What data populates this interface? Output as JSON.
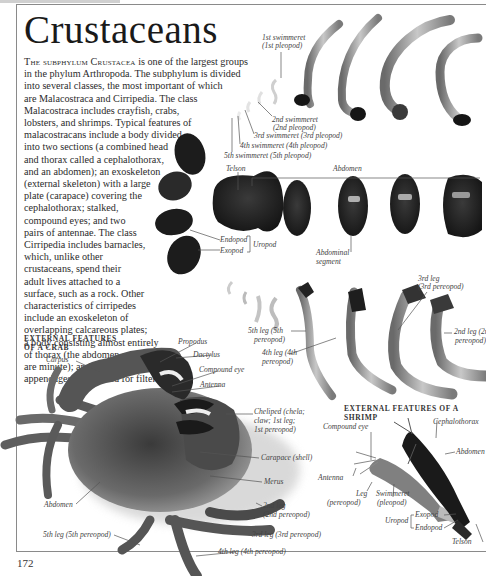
{
  "page": {
    "title": "Crustaceans",
    "page_number": "172"
  },
  "intro": {
    "lead_smallcaps": "The subphylum Crustacea",
    "lines": [
      " is one of the largest groups",
      "in the phylum Arthropoda. The subphylum is divided",
      "into several classes, the most important of which",
      "are Malacostraca and Cirripedia. The class",
      "Malacostraca includes crayfish, crabs,",
      "lobsters, and shrimps. Typical features of",
      "malacostracans include a body divided",
      "into two sections (a combined head",
      "and thorax called a cephalothorax,",
      "and an abdomen); an exoskeleton",
      "(external skeleton) with a large",
      "plate (carapace) covering the",
      "cephalothorax; stalked,",
      "compound eyes; and two",
      "pairs of antennae. The class",
      "Cirripedia includes barnacles,",
      "which, unlike other",
      "crustaceans, spend their",
      "adult lives attached to a",
      "surface, such as a rock. Other",
      "characteristics of cirripedes",
      "include an exoskeleton of",
      "overlapping calcareous plates;",
      "a body consisting almost entirely",
      "of thorax (the abdomen and head",
      "are minute); and six pairs of thoracic",
      "appendages (cirri) used for filter feeding."
    ]
  },
  "swimmerets": {
    "labels": [
      "1st swimmeret",
      "(1st pleopod)",
      "2nd swimmeret",
      "(2nd pleopod)",
      "3rd swimmeret (3rd pleopod)",
      "4th swimmeret (4th pleopod)",
      "5th swimmeret (5th pleopod)"
    ]
  },
  "tail": {
    "telson": "Telson",
    "abdomen": "Abdomen",
    "endopod": "Endopod",
    "exopod": "Exopod",
    "uropod": "Uropod",
    "abdominal_segment_1": "Abdominal",
    "abdominal_segment_2": "segment"
  },
  "legs": {
    "third_1": "3rd leg",
    "third_2": "(3rd pereopod)",
    "fifth_1": "5th leg (5th",
    "fifth_2": "pereopod)",
    "fourth_1": "4th leg (4th",
    "fourth_2": "pereopod)",
    "second_1": "2nd leg (2nd",
    "second_2": "pereopod)"
  },
  "crab": {
    "heading_1": "External features",
    "heading_2": "of a crab",
    "labels": {
      "carpus": "Carpus",
      "propodus": "Propodus",
      "dactylus": "Dactylus",
      "compound_eye": "Compound eye",
      "antenna": "Antenna",
      "cheliped_1": "Cheliped (chela;",
      "cheliped_2": "claw; 1st leg;",
      "cheliped_3": "1st pereopod)",
      "carapace": "Carapace (shell)",
      "merus": "Merus",
      "leg2_1": "2nd leg",
      "leg2_2": "(2nd pereopod)",
      "leg3": "3rd leg (3rd pereopod)",
      "leg4": "4th leg (4th pereopod)",
      "leg5": "5th leg (5th pereopod)",
      "abdomen": "Abdomen"
    }
  },
  "shrimp": {
    "heading": "External features of a shrimp",
    "labels": {
      "compound_eye": "Compound eye",
      "cephalothorax": "Cephalothorax",
      "abdomen": "Abdomen",
      "antenna": "Antenna",
      "leg_1": "Leg",
      "leg_2": "(pereopod)",
      "swimmeret_1": "Swimmeret",
      "swimmeret_2": "(pleopod)",
      "uropod": "Uropod",
      "exopod": "Exopod",
      "endopod": "Endopod",
      "telson": "Telson"
    }
  },
  "colors": {
    "text": "#2a2a2a",
    "frame": "#8a8a8a",
    "specimen_dark": "#1e1e1e",
    "specimen_light": "#b8b8b8"
  }
}
